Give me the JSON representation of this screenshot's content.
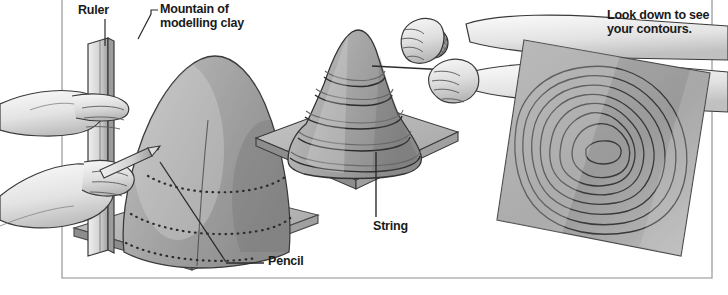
{
  "figure": {
    "border_color": "#8d8d8d",
    "ink_color": "#1a1a1a",
    "palette": {
      "clay_light": "#c9c9c9",
      "clay_mid": "#a9a9a9",
      "clay_dark": "#8a8a8a",
      "board_top": "#bdbdbd",
      "board_edge": "#8f8f8f",
      "map_fill": "#9d9d9d",
      "skin_light": "#f2f2f2",
      "skin_shade": "#c6c6c6",
      "line": "#2b2b2b"
    }
  },
  "labels": [
    {
      "id": "ruler",
      "text": "Ruler",
      "x": 78,
      "y": 4,
      "leader": "vertical"
    },
    {
      "id": "mountain",
      "text": "Mountain of\nmodelling clay",
      "x": 160,
      "y": 4,
      "leader": "elbow"
    },
    {
      "id": "contours",
      "text": "Look down to see\nyour contours.",
      "x": 607,
      "y": 10,
      "leader": "none"
    },
    {
      "id": "string",
      "text": "String",
      "x": 373,
      "y": 221,
      "leader": "vertical"
    },
    {
      "id": "pencil",
      "text": "Pencil",
      "x": 268,
      "y": 255,
      "leader": "horizontal"
    }
  ],
  "panels": [
    {
      "id": "panel-draw",
      "caption": "Hand holds ruler and pencil marking a contour on a clay mountain"
    },
    {
      "id": "panel-cut",
      "caption": "Hands pull string to cut the clay mountain into level slices"
    },
    {
      "id": "panel-map",
      "caption": "Square board viewed from above showing nested contour rings"
    }
  ],
  "contour_map": {
    "ring_count": 8,
    "stroke": "#3a3a3a"
  }
}
